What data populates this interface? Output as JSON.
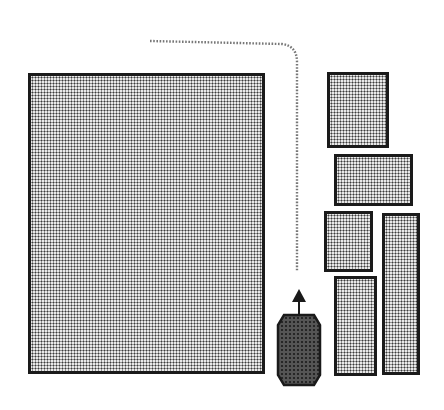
{
  "diagram": {
    "obstacles": [
      {
        "id": "large-block",
        "x": 28,
        "y": 73,
        "w": 237,
        "h": 301
      },
      {
        "id": "block-1",
        "x": 327,
        "y": 72,
        "w": 62,
        "h": 76
      },
      {
        "id": "block-2",
        "x": 334,
        "y": 154,
        "w": 79,
        "h": 52
      },
      {
        "id": "block-3",
        "x": 324,
        "y": 211,
        "w": 49,
        "h": 61
      },
      {
        "id": "block-4",
        "x": 382,
        "y": 213,
        "w": 38,
        "h": 162
      },
      {
        "id": "block-5",
        "x": 334,
        "y": 276,
        "w": 43,
        "h": 100
      }
    ],
    "path": {
      "style": "dotted",
      "points": [
        [
          150,
          41
        ],
        [
          282,
          44
        ],
        [
          297,
          62
        ],
        [
          297,
          272
        ]
      ]
    },
    "robot": {
      "x": 278,
      "y": 315,
      "w": 42,
      "h": 70,
      "heading": "up",
      "color": "#3a3a3a"
    },
    "colors": {
      "outline": "#1a1a1a",
      "fill_dots": "#3a3a3a",
      "background": "#ffffff"
    }
  }
}
